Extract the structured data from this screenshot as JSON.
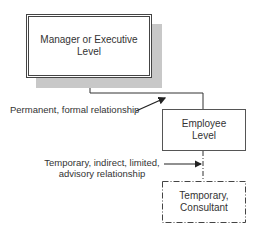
{
  "diagram": {
    "nodes": {
      "manager": {
        "line1": "Manager or Executive",
        "line2": "Level"
      },
      "employee": {
        "line1": "Employee",
        "line2": "Level"
      },
      "temporary": {
        "line1": "Temporary,",
        "line2": "Consultant"
      }
    },
    "edges": {
      "permanent": {
        "label": "Permanent, formal relationship",
        "style": "solid"
      },
      "temporary": {
        "line1": "Temporary, indirect, limited,",
        "line2": "advisory relationship",
        "style": "dash-dot"
      }
    },
    "colors": {
      "line": "#333333",
      "shadow": "#c8c8c8"
    }
  }
}
